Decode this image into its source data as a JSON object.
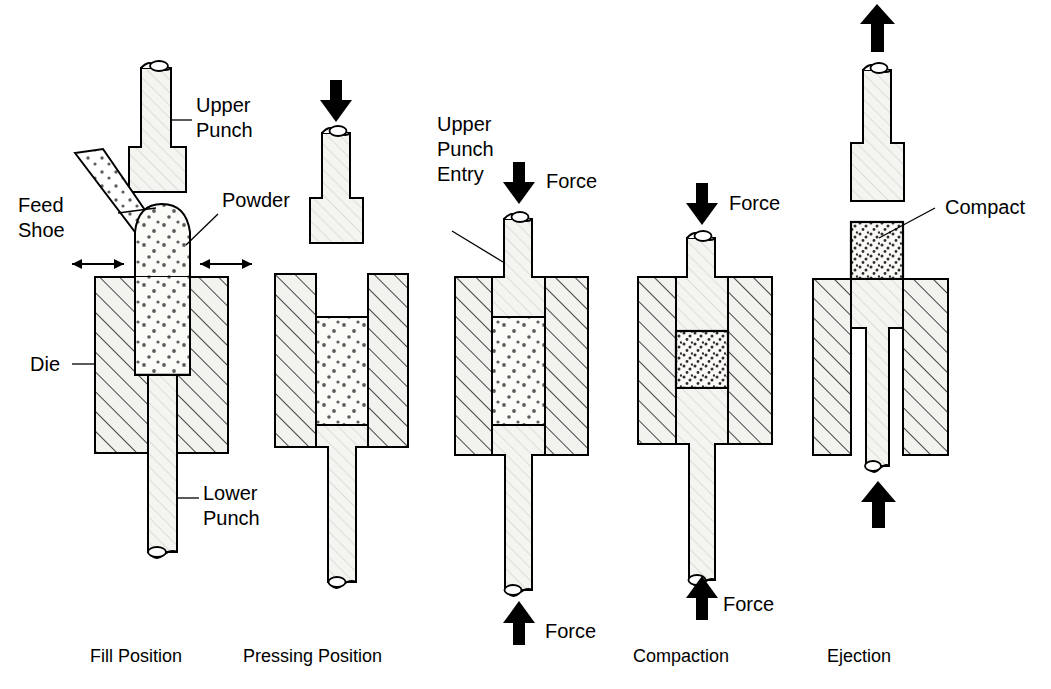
{
  "figure": {
    "colors": {
      "line": "#000000",
      "background": "#ffffff",
      "die_fill": "#f2f2ee",
      "punch_fill": "#f4f4f0",
      "powder_fill": "#fbfbf8",
      "powder_dot": "#6b6b6b",
      "compact_dot": "#3a3a3a",
      "arrow": "#000000"
    }
  },
  "captions": [
    {
      "id": "fill",
      "label": "Fill Position",
      "x": 132,
      "y": 662
    },
    {
      "id": "pressing",
      "label": "Pressing Position",
      "x": 276,
      "y": 662
    },
    {
      "id": "entry",
      "label": "",
      "x": 470,
      "y": 662
    },
    {
      "id": "compaction",
      "label": "Compaction",
      "x": 662,
      "y": 662
    },
    {
      "id": "ejection",
      "label": "Ejection",
      "x": 855,
      "y": 662
    }
  ],
  "annotations": {
    "upper_punch": {
      "line1": "Upper",
      "line2": "Punch",
      "x": 196,
      "y": 112
    },
    "feed_shoe": {
      "line1": "Feed",
      "line2": "Shoe",
      "x": 18,
      "y": 212
    },
    "powder": {
      "label": "Powder",
      "x": 222,
      "y": 207
    },
    "die": {
      "label": "Die",
      "x": 38,
      "y": 364
    },
    "lower_punch": {
      "line1": "Lower",
      "line2": "Punch",
      "x": 203,
      "y": 500
    },
    "upper_punch_entry": {
      "line1": "Upper",
      "line2": "Punch",
      "line3": "Entry",
      "x": 437,
      "y": 131
    },
    "compact": {
      "label": "Compact",
      "x": 945,
      "y": 214
    }
  },
  "force_labels": [
    {
      "id": "force-entry-top",
      "label": "Force",
      "x": 546,
      "y": 188
    },
    {
      "id": "force-entry-bottom",
      "label": "Force",
      "x": 561,
      "y": 636
    },
    {
      "id": "force-compaction-top",
      "label": "Force",
      "x": 729,
      "y": 210
    },
    {
      "id": "force-compaction-bottom",
      "label": "Force",
      "x": 723,
      "y": 611
    }
  ],
  "stages": [
    {
      "id": "fill",
      "name": "Fill Position",
      "description": "Powder flows from the feed shoe into the die cavity; lower punch is retracted, upper punch is raised clear.",
      "upper_punch_position": "raised clear above die",
      "powder_state": "loose powder",
      "arrows": [
        "feed-shoe-left-double",
        "feed-shoe-right-double"
      ]
    },
    {
      "id": "pressing",
      "name": "Pressing Position",
      "description": "Feed shoe withdrawn; upper punch descends toward the filled die cavity.",
      "upper_punch_position": "descending above die",
      "powder_state": "loose powder",
      "arrows": [
        "down-solid-top"
      ]
    },
    {
      "id": "entry",
      "name": "Upper Punch Entry",
      "description": "Upper punch enters the die bore and begins to contact the powder column under applied force.",
      "upper_punch_position": "entered die bore",
      "powder_state": "loose powder",
      "arrows": [
        "down-solid-top-force",
        "up-solid-bottom-force"
      ]
    },
    {
      "id": "compaction",
      "name": "Compaction",
      "description": "Opposing forces from the upper and lower punches densify the powder into a green compact.",
      "upper_punch_position": "pressing into die",
      "powder_state": "compacted powder",
      "arrows": [
        "down-solid-top-force",
        "up-solid-bottom-force"
      ]
    },
    {
      "id": "ejection",
      "name": "Ejection",
      "description": "Upper punch withdraws upward while the lower punch rises to push the compact out of the die.",
      "upper_punch_position": "withdrawing upward",
      "powder_state": "green compact ejected",
      "arrows": [
        "up-solid-top",
        "up-solid-bottom"
      ]
    }
  ]
}
